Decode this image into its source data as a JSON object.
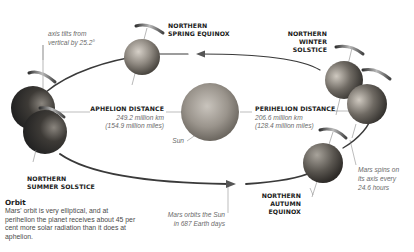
{
  "labels": {
    "spring_equinox": [
      "NORTHERN",
      "SPRING EQUINOX"
    ],
    "winter_solstice": [
      "NORTHERN",
      "WINTER",
      "SOLSTICE"
    ],
    "summer_solstice": [
      "NORTHERN",
      "SUMMER SOLSTICE"
    ],
    "autumn_equinox": [
      "NORTHERN",
      "AUTUMN",
      "EQUINOX"
    ],
    "axis_tilt": [
      "axis tilts from",
      "vertical by 25.2°"
    ],
    "aphelion_title": "APHELION DISTANCE",
    "aphelion_km": "249.2 million km",
    "aphelion_miles": "(154.9 million miles)",
    "perihelion_title": "PERIHELION DISTANCE",
    "perihelion_km": "206.6 million km",
    "perihelion_miles": "(128.4 million miles)",
    "sun": "Sun",
    "spin": [
      "Mars spins on",
      "its axis every",
      "24.6 hours"
    ],
    "orbit_period": [
      "Mars orbits the Sun",
      "in 687 Earth days"
    ]
  },
  "caption": {
    "title": "Orbit",
    "text": "Mars' orbit is very elliptical, and at perihelion the planet receives about 45 per cent more solar radiation than it does at aphelion."
  },
  "colors": {
    "orbit_line": "#3a3a3a",
    "leader_line": "#7a7a7a",
    "label_text": "#1a1a1a",
    "italic_text": "#6a6a6a"
  }
}
